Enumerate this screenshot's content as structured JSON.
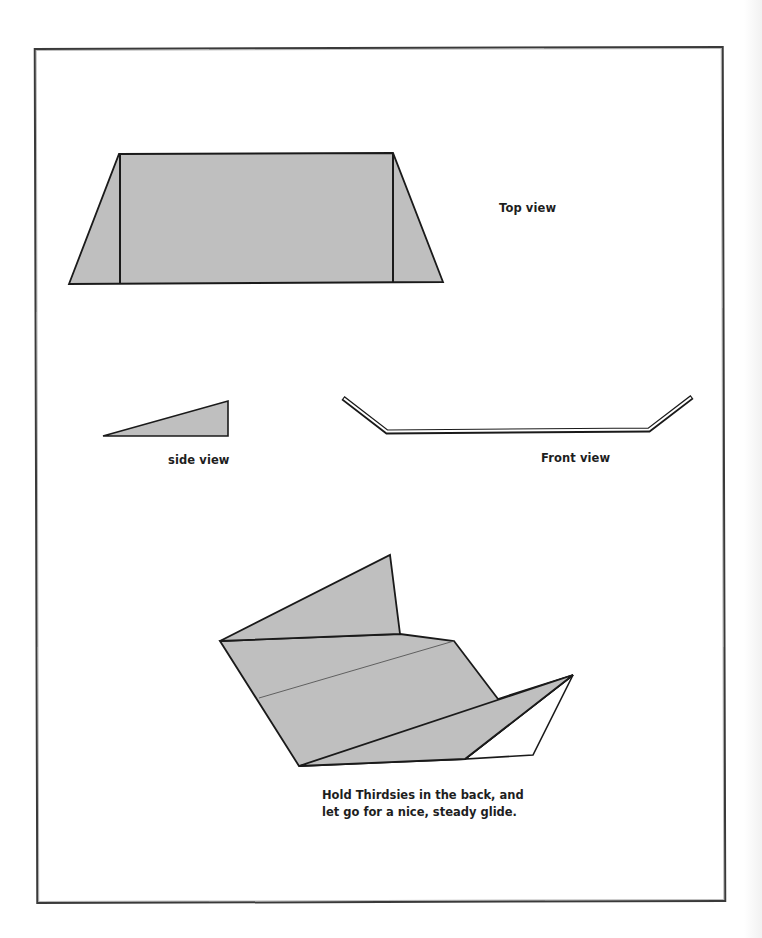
{
  "page": {
    "background": "#ffffff",
    "frame_color": "#3a3a3a"
  },
  "colors": {
    "paper_fill": "#bfbfbf",
    "outline": "#1a1a1a",
    "white_face": "#ffffff",
    "fold_line": "#555555"
  },
  "figures": {
    "top_view": {
      "label": "Top view",
      "outline": [
        [
          69,
          284
        ],
        [
          119,
          154
        ],
        [
          393,
          153
        ],
        [
          443,
          282
        ]
      ],
      "fold_lines": [
        [
          [
            120,
            155
          ],
          [
            120,
            284
          ]
        ],
        [
          [
            393,
            153
          ],
          [
            393,
            283
          ]
        ]
      ]
    },
    "side_view": {
      "label": "side view",
      "outline": [
        [
          103,
          436
        ],
        [
          228,
          401
        ],
        [
          228,
          436
        ]
      ]
    },
    "front_view": {
      "label": "Front view",
      "path": [
        [
          343,
          398
        ],
        [
          387,
          432
        ],
        [
          649,
          430
        ],
        [
          692,
          397
        ]
      ]
    },
    "perspective_view": {
      "caption_line_1": "Hold Thirdsies in the back, and",
      "caption_line_2": "let go for a nice, steady glide."
    }
  }
}
